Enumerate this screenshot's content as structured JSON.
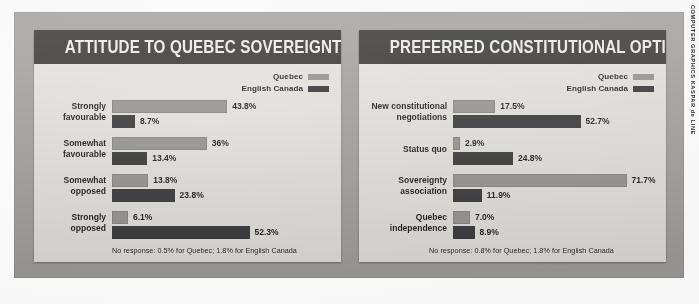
{
  "credit": "COMPUTER GRAPHICS KASPAR de LINE",
  "colors": {
    "header_bar": "#3b3a38",
    "panel_background": "#eceae6",
    "mount_background": "#a9a7a4",
    "quebec_series": "#9d9b97",
    "english_canada_series": "#3d3c3e"
  },
  "legend": {
    "quebec_label": "Quebec",
    "english_canada_label": "English Canada"
  },
  "panels": [
    {
      "title": "ATTITUDE TO QUEBEC SOVEREIGNTY",
      "footnote": "No response: 0.5% for Quebec; 1.8% for English Canada"
    },
    {
      "title": "PREFERRED CONSTITUTIONAL OPTION",
      "footnote": "No response: 0.8% for Quebec; 1.8% for English Canada"
    }
  ],
  "chart_data": [
    {
      "type": "bar",
      "orientation": "horizontal",
      "title": "ATTITUDE TO QUEBEC SOVEREIGNTY",
      "xlabel": "",
      "ylabel": "",
      "grid": false,
      "legend_position": "top-right",
      "xlim": [
        0,
        55
      ],
      "note": "No response: 0.5% for Quebec; 1.8% for English Canada",
      "categories": [
        "Strongly favourable",
        "Somewhat favourable",
        "Somewhat opposed",
        "Strongly opposed"
      ],
      "category_lines": [
        [
          "Strongly",
          "favourable"
        ],
        [
          "Somewhat",
          "favourable"
        ],
        [
          "Somewhat",
          "opposed"
        ],
        [
          "Strongly",
          "opposed"
        ]
      ],
      "series": [
        {
          "name": "Quebec",
          "color": "#9d9b97",
          "values": [
            43.8,
            36,
            13.8,
            6.1
          ],
          "labels": [
            "43.8%",
            "36%",
            "13.8%",
            "6.1%"
          ]
        },
        {
          "name": "English Canada",
          "color": "#3d3c3e",
          "values": [
            8.7,
            13.4,
            23.8,
            52.3
          ],
          "labels": [
            "8.7%",
            "13.4%",
            "23.8%",
            "52.3%"
          ]
        }
      ]
    },
    {
      "type": "bar",
      "orientation": "horizontal",
      "title": "PREFERRED CONSTITUTIONAL OPTION",
      "xlabel": "",
      "ylabel": "",
      "grid": false,
      "legend_position": "top-right",
      "xlim": [
        0,
        75
      ],
      "note": "No response: 0.8% for Quebec; 1.8% for English Canada",
      "categories": [
        "New constitutional negotiations",
        "Status quo",
        "Sovereignty association",
        "Quebec independence"
      ],
      "category_lines": [
        [
          "New constitutional",
          "negotiations"
        ],
        [
          "Status quo",
          ""
        ],
        [
          "Sovereignty",
          "association"
        ],
        [
          "Quebec",
          "independence"
        ]
      ],
      "series": [
        {
          "name": "Quebec",
          "color": "#9d9b97",
          "values": [
            17.5,
            2.9,
            71.7,
            7.0
          ],
          "labels": [
            "17.5%",
            "2.9%",
            "71.7%",
            "7.0%"
          ]
        },
        {
          "name": "English Canada",
          "color": "#3d3c3e",
          "values": [
            52.7,
            24.8,
            11.9,
            8.9
          ],
          "labels": [
            "52.7%",
            "24.8%",
            "11.9%",
            "8.9%"
          ]
        }
      ]
    }
  ]
}
